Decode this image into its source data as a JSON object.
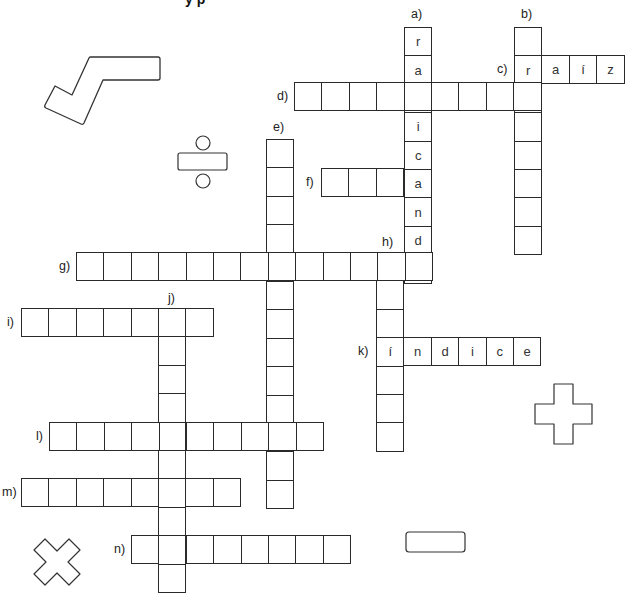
{
  "title": {
    "text": "y p"
  },
  "grid": {
    "cell_w": 27.4,
    "cell_h": 28.4,
    "border_color": "#2a2a2a"
  },
  "words": [
    {
      "id": "a",
      "label": "a)",
      "dir": "down",
      "x": 404,
      "y": 27,
      "length": 9,
      "letters": [
        "r",
        "a",
        "d",
        "i",
        "c",
        "a",
        "n",
        "d",
        "o"
      ],
      "label_x": 411,
      "label_y": 7
    },
    {
      "id": "b",
      "label": "b)",
      "dir": "down",
      "x": 514,
      "y": 27,
      "length": 8,
      "letters": [
        "",
        "",
        "",
        "",
        "",
        "",
        "",
        ""
      ],
      "label_x": 521,
      "label_y": 7
    },
    {
      "id": "c",
      "label": "c)",
      "dir": "across",
      "x": 514,
      "y": 55,
      "length": 4,
      "letters": [
        "r",
        "a",
        "í",
        "z"
      ],
      "label_x": 497,
      "label_y": 62
    },
    {
      "id": "d",
      "label": "d)",
      "dir": "across",
      "x": 294,
      "y": 82,
      "length": 9,
      "letters": [
        "",
        "",
        "",
        "",
        "",
        "",
        "",
        "",
        ""
      ],
      "label_x": 277,
      "label_y": 89
    },
    {
      "id": "e",
      "label": "e)",
      "dir": "down",
      "x": 266,
      "y": 139,
      "length": 13,
      "letters": [
        "",
        "",
        "",
        "",
        "",
        "",
        "",
        "",
        "",
        "",
        "",
        "",
        ""
      ],
      "label_x": 273,
      "label_y": 120
    },
    {
      "id": "f",
      "label": "f)",
      "dir": "across",
      "x": 321,
      "y": 168,
      "length": 4,
      "letters": [
        "",
        "",
        "",
        ""
      ],
      "label_x": 306,
      "label_y": 175
    },
    {
      "id": "g",
      "label": "g)",
      "dir": "across",
      "x": 76,
      "y": 252,
      "length": 13,
      "letters": [
        "",
        "",
        "",
        "",
        "",
        "",
        "",
        "",
        "",
        "",
        "",
        "",
        ""
      ],
      "label_x": 59,
      "label_y": 259
    },
    {
      "id": "h",
      "label": "h)",
      "dir": "down",
      "x": 376,
      "y": 252,
      "length": 7,
      "letters": [
        "",
        "",
        "",
        "",
        "",
        "",
        ""
      ],
      "label_x": 382,
      "label_y": 235
    },
    {
      "id": "i",
      "label": "i)",
      "dir": "across",
      "x": 21,
      "y": 308,
      "length": 7,
      "letters": [
        "",
        "",
        "",
        "",
        "",
        "",
        ""
      ],
      "label_x": 7,
      "label_y": 315
    },
    {
      "id": "j",
      "label": "j)",
      "dir": "down",
      "x": 158,
      "y": 308,
      "length": 10,
      "letters": [
        "",
        "",
        "",
        "",
        "",
        "",
        "",
        "",
        "",
        ""
      ],
      "label_x": 168,
      "label_y": 291
    },
    {
      "id": "k",
      "label": "k)",
      "dir": "across",
      "x": 376,
      "y": 337,
      "length": 6,
      "letters": [
        "í",
        "n",
        "d",
        "i",
        "c",
        "e"
      ],
      "label_x": 358,
      "label_y": 344
    },
    {
      "id": "l",
      "label": "l)",
      "dir": "across",
      "x": 49,
      "y": 422,
      "length": 10,
      "letters": [
        "",
        "",
        "",
        "",
        "",
        "",
        "",
        "",
        "",
        ""
      ],
      "label_x": 36,
      "label_y": 429
    },
    {
      "id": "m",
      "label": "m)",
      "dir": "across",
      "x": 21,
      "y": 478,
      "length": 8,
      "letters": [
        "",
        "",
        "",
        "",
        "",
        "",
        "",
        ""
      ],
      "label_x": 2,
      "label_y": 485
    },
    {
      "id": "n",
      "label": "n)",
      "dir": "across",
      "x": 131,
      "y": 535,
      "length": 8,
      "letters": [
        "",
        "",
        "",
        "",
        "",
        "",
        "",
        ""
      ],
      "label_x": 114,
      "label_y": 542
    }
  ],
  "decorations": [
    {
      "name": "square-root-icon",
      "symbol": "√"
    },
    {
      "name": "division-icon",
      "symbol": "÷"
    },
    {
      "name": "plus-icon",
      "symbol": "+"
    },
    {
      "name": "minus-icon",
      "symbol": "−"
    },
    {
      "name": "multiply-icon",
      "symbol": "×"
    }
  ]
}
